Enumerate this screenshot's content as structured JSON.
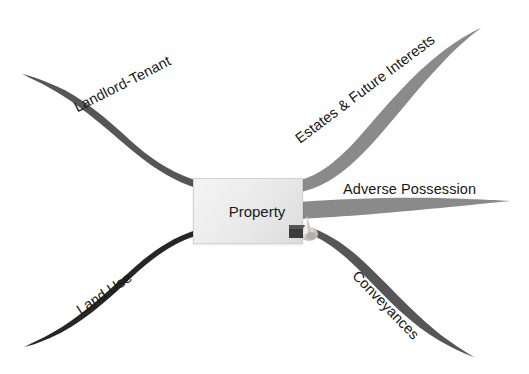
{
  "diagram": {
    "type": "mind-map",
    "title": "Property",
    "background_color": "#ffffff",
    "central_node": {
      "label": "Property",
      "fill_color": "#ececec",
      "border_color": "#d2d2d2",
      "text_color": "#1a1a1a"
    },
    "ornament": {
      "name": "pin-ornament",
      "colors": [
        "#3a3a3a",
        "#f0ede6",
        "#b9b4ab"
      ]
    },
    "branches": [
      {
        "id": "landlord-tenant",
        "label": "Landlord-Tenant",
        "color": "#565656",
        "direction": "upper-left",
        "label_rotation": -27,
        "label_x": 75,
        "label_y": 100
      },
      {
        "id": "estates-future-interests",
        "label": "Estates & Future Interests",
        "color": "#8a8a8a",
        "direction": "upper-right",
        "label_rotation": -37,
        "label_x": 297,
        "label_y": 132
      },
      {
        "id": "adverse-possession",
        "label": "Adverse Possession",
        "color": "#8a8a8a",
        "direction": "right",
        "label_rotation": 0,
        "label_x": 343,
        "label_y": 188
      },
      {
        "id": "conveyances",
        "label": "Conveyances",
        "color": "#565656",
        "direction": "lower-right",
        "label_rotation": 46,
        "label_x": 355,
        "label_y": 265
      },
      {
        "id": "land-use",
        "label": "Land Use",
        "color": "#262626",
        "direction": "lower-left",
        "label_rotation": -34,
        "label_x": 78,
        "label_y": 303
      }
    ]
  }
}
